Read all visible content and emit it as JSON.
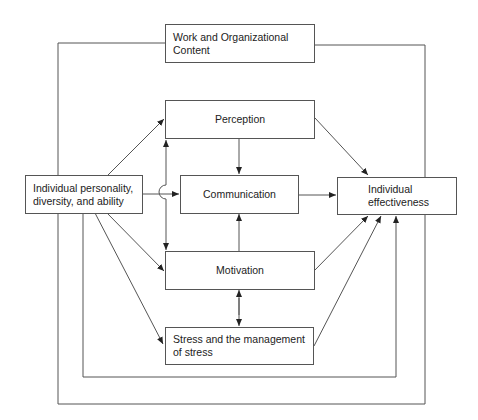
{
  "diagram": {
    "nodes": {
      "context": {
        "line1": "Work and Organizational",
        "line2": "Content"
      },
      "perception": {
        "label": "Perception"
      },
      "communication": {
        "label": "Communication"
      },
      "motivation": {
        "label": "Motivation"
      },
      "stress": {
        "line1": "Stress and the management",
        "line2": "of stress"
      },
      "individual": {
        "line1": "Individual personality,",
        "line2": "diversity, and ability"
      },
      "effectiveness": {
        "line1": "Individual",
        "line2": "effectiveness"
      }
    },
    "edges": [
      {
        "from": "individual",
        "to": "perception"
      },
      {
        "from": "individual",
        "to": "communication"
      },
      {
        "from": "individual",
        "to": "motivation"
      },
      {
        "from": "individual",
        "to": "stress"
      },
      {
        "from": "perception",
        "to": "communication"
      },
      {
        "from": "motivation",
        "to": "communication"
      },
      {
        "from": "motivation",
        "to": "stress",
        "bidirectional": true
      },
      {
        "from": "perception",
        "to": "effectiveness"
      },
      {
        "from": "communication",
        "to": "effectiveness"
      },
      {
        "from": "motivation",
        "to": "effectiveness"
      },
      {
        "from": "stress",
        "to": "effectiveness"
      },
      {
        "from": "individual",
        "to": "effectiveness",
        "via": "inner-loop"
      },
      {
        "from": "context",
        "to": "effectiveness",
        "via": "outer-loop"
      },
      {
        "from": "perception",
        "to": "motivation",
        "bidirectional": true,
        "via": "left-vertical"
      }
    ]
  }
}
